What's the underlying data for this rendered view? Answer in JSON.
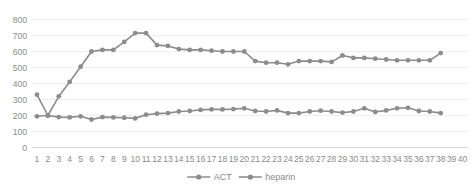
{
  "chart_data": {
    "type": "line",
    "title": "",
    "xlabel": "",
    "ylabel": "",
    "ylim": [
      0,
      800
    ],
    "ytick_labels": [
      "0",
      "100",
      "200",
      "300",
      "400",
      "500",
      "600",
      "700",
      "800"
    ],
    "ytick_values": [
      0,
      100,
      200,
      300,
      400,
      500,
      600,
      700,
      800
    ],
    "grid": true,
    "legend_position": "bottom-center",
    "categories": [
      "1",
      "2",
      "3",
      "4",
      "5",
      "6",
      "7",
      "8",
      "9",
      "10",
      "11",
      "12",
      "13",
      "14",
      "15",
      "16",
      "17",
      "18",
      "19",
      "20",
      "21",
      "22",
      "23",
      "24",
      "25",
      "26",
      "27",
      "28",
      "29",
      "30",
      "31",
      "32",
      "33",
      "34",
      "35",
      "36",
      "37",
      "38",
      "39",
      "40"
    ],
    "series": [
      {
        "name": "ACT",
        "color": "#8c8c8c",
        "values": [
          330,
          200,
          320,
          410,
          505,
          600,
          610,
          610,
          660,
          715,
          715,
          640,
          635,
          615,
          610,
          610,
          605,
          600,
          600,
          600,
          540,
          530,
          530,
          520,
          540,
          540,
          540,
          535,
          575,
          560,
          560,
          555,
          550,
          545,
          545,
          545,
          545,
          590,
          null,
          null
        ]
      },
      {
        "name": "heparin",
        "color": "#8c8c8c",
        "values": [
          195,
          200,
          190,
          188,
          195,
          175,
          190,
          188,
          186,
          182,
          205,
          212,
          215,
          225,
          228,
          235,
          238,
          238,
          240,
          245,
          228,
          225,
          232,
          215,
          215,
          225,
          230,
          225,
          218,
          225,
          245,
          222,
          232,
          245,
          248,
          228,
          225,
          215,
          null,
          null
        ]
      }
    ],
    "legend": [
      {
        "label": "ACT",
        "color": "#8c8c8c"
      },
      {
        "label": "heparin",
        "color": "#8c8c8c"
      }
    ]
  }
}
